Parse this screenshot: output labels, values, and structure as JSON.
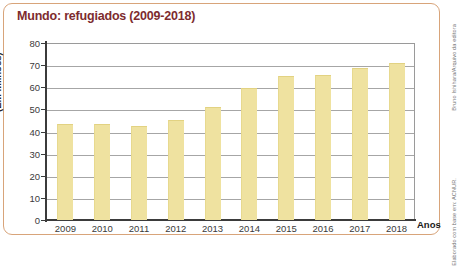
{
  "title": "Mundo: refugiados (2009-2018)",
  "credit": {
    "line1": "Bruno Ishihara/Arquivo da editora",
    "line2": "Elaborado com base em: ACNUR."
  },
  "axis": {
    "x_caption": "Anos",
    "y_caption": "(Em milhões)",
    "y_ticks": [
      "80",
      "70",
      "60",
      "50",
      "40",
      "30",
      "20",
      "10",
      "0"
    ]
  },
  "colors": {
    "title": "#7d2b2e",
    "frame": "#d8a47a",
    "bar": "#efe2a0",
    "axis": "#3b3b3b",
    "grid": "#a6a6a6"
  },
  "chart_data": {
    "type": "bar",
    "title": "Mundo: refugiados (2009-2018)",
    "xlabel": "Anos",
    "ylabel": "(Em milhões)",
    "categories": [
      "2009",
      "2010",
      "2011",
      "2012",
      "2013",
      "2014",
      "2015",
      "2016",
      "2017",
      "2018"
    ],
    "values": [
      43.3,
      43.3,
      42.5,
      45.2,
      51.2,
      59.5,
      65.3,
      65.6,
      68.5,
      70.8
    ],
    "ylim": [
      0,
      80
    ],
    "ytick_step": 10,
    "grid": true,
    "legend": false
  }
}
